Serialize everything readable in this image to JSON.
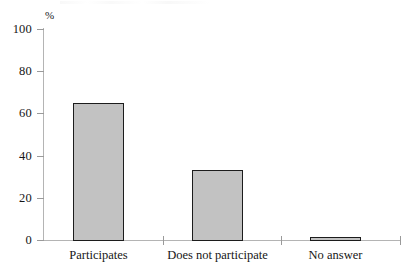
{
  "chart_data": {
    "type": "bar",
    "title": "",
    "subtitle": "",
    "xlabel": "",
    "ylabel": "%",
    "unit_label": "%",
    "categories": [
      "Participates",
      "Does not participate",
      "No answer"
    ],
    "values": [
      65.5,
      33.5,
      1.5
    ],
    "ylim": [
      0,
      100
    ],
    "yticks": [
      0,
      20,
      40,
      60,
      80,
      100
    ],
    "ytick_labels": [
      "0",
      "20",
      "40",
      "60",
      "80",
      "100"
    ],
    "grid": false,
    "legend": false,
    "legend_position": "none",
    "series": [
      {
        "name": "",
        "values": [
          65.5,
          33.5,
          1.5
        ]
      }
    ],
    "annotations": [],
    "colors": {
      "bar_fill": "#c2c2c2",
      "bar_border": "#1c1c1c",
      "axis": "#b4b4b4",
      "tick": "#9a9a9a",
      "text": "#161616",
      "background": "#ffffff"
    }
  },
  "axis": {
    "y_unit": "%",
    "ticks": [
      {
        "label": "100",
        "value": 100
      },
      {
        "label": "80",
        "value": 80
      },
      {
        "label": "60",
        "value": 60
      },
      {
        "label": "40",
        "value": 40
      },
      {
        "label": "20",
        "value": 20
      },
      {
        "label": "0",
        "value": 0
      }
    ]
  },
  "categories": [
    {
      "label": "Participates",
      "value": 65.5
    },
    {
      "label": "Does not participate",
      "value": 33.5
    },
    {
      "label": "No answer",
      "value": 1.5
    }
  ]
}
